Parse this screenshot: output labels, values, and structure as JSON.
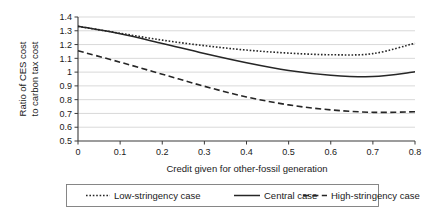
{
  "chart_data": {
    "type": "line",
    "title": "",
    "xlabel": "Credit given for other-fossil generation",
    "ylabel_line1": "Ratio of CES cost",
    "ylabel_line2": "to carbon tax cost",
    "x": [
      0,
      0.1,
      0.2,
      0.3,
      0.4,
      0.5,
      0.6,
      0.7,
      0.8
    ],
    "xlim": [
      0,
      0.8
    ],
    "ylim": [
      0.5,
      1.4
    ],
    "xticks": [
      "0",
      "0.1",
      "0.2",
      "0.3",
      "0.4",
      "0.5",
      "0.6",
      "0.7",
      "0.8"
    ],
    "xtick_values": [
      0,
      0.1,
      0.2,
      0.3,
      0.4,
      0.5,
      0.6,
      0.7,
      0.8
    ],
    "yticks": [
      "0.5",
      "0.6",
      "0.7",
      "0.8",
      "0.9",
      "1",
      "1.1",
      "1.2",
      "1.3",
      "1.4"
    ],
    "ytick_values": [
      0.5,
      0.6,
      0.7,
      0.8,
      0.9,
      1.0,
      1.1,
      1.2,
      1.3,
      1.4
    ],
    "grid": true,
    "grid_axis": "y",
    "legend_position": "bottom",
    "series": [
      {
        "name": "Low-stringency case",
        "style": "dotted",
        "dasharray": "1.6,1.8",
        "width": 1.6,
        "color": "#262626",
        "values": [
          1.332,
          1.282,
          1.232,
          1.192,
          1.16,
          1.138,
          1.126,
          1.134,
          1.21
        ]
      },
      {
        "name": "Central case",
        "style": "solid",
        "dasharray": "none",
        "width": 1.5,
        "color": "#262626",
        "values": [
          1.333,
          1.278,
          1.208,
          1.135,
          1.068,
          1.012,
          0.978,
          0.968,
          1.002
        ]
      },
      {
        "name": "High-stringency case",
        "style": "dashed",
        "dasharray": "6,3.4",
        "width": 1.6,
        "color": "#262626",
        "values": [
          1.155,
          1.072,
          0.985,
          0.897,
          0.82,
          0.762,
          0.726,
          0.708,
          0.712
        ]
      }
    ]
  },
  "legend": {
    "items": [
      {
        "label": "Low-stringency case",
        "style": "dotted"
      },
      {
        "label": "Central case",
        "style": "solid"
      },
      {
        "label": "High-stringency case",
        "style": "dashed"
      }
    ]
  }
}
